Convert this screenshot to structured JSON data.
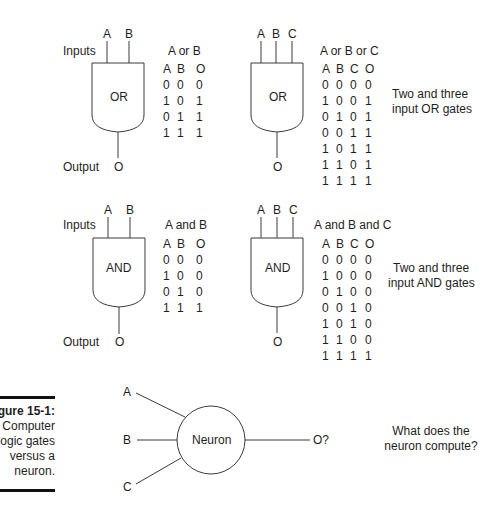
{
  "or_section": {
    "inputs_label": "Inputs",
    "output_label": "Output",
    "two_input": {
      "gate_label": "OR",
      "input_labels": [
        "A",
        "B"
      ],
      "output_label": "O",
      "table_title": "A or B",
      "headers": [
        "A",
        "B",
        "O"
      ],
      "rows": [
        [
          "0",
          "0",
          "0"
        ],
        [
          "1",
          "0",
          "1"
        ],
        [
          "0",
          "1",
          "1"
        ],
        [
          "1",
          "1",
          "1"
        ]
      ]
    },
    "three_input": {
      "gate_label": "OR",
      "input_labels": [
        "A",
        "B",
        "C"
      ],
      "output_label": "O",
      "table_title": "A or B or C",
      "headers": [
        "A",
        "B",
        "C",
        "O"
      ],
      "rows": [
        [
          "0",
          "0",
          "0",
          "0"
        ],
        [
          "1",
          "0",
          "0",
          "1"
        ],
        [
          "0",
          "1",
          "0",
          "1"
        ],
        [
          "0",
          "0",
          "1",
          "1"
        ],
        [
          "1",
          "0",
          "1",
          "1"
        ],
        [
          "1",
          "1",
          "0",
          "1"
        ],
        [
          "1",
          "1",
          "1",
          "1"
        ]
      ]
    },
    "description_line1": "Two and three",
    "description_line2": "input OR gates"
  },
  "and_section": {
    "inputs_label": "Inputs",
    "output_label": "Output",
    "two_input": {
      "gate_label": "AND",
      "input_labels": [
        "A",
        "B"
      ],
      "output_label": "O",
      "table_title": "A and B",
      "headers": [
        "A",
        "B",
        "O"
      ],
      "rows": [
        [
          "0",
          "0",
          "0"
        ],
        [
          "1",
          "0",
          "0"
        ],
        [
          "0",
          "1",
          "0"
        ],
        [
          "1",
          "1",
          "1"
        ]
      ]
    },
    "three_input": {
      "gate_label": "AND",
      "input_labels": [
        "A",
        "B",
        "C"
      ],
      "output_label": "O",
      "table_title": "A and B and C",
      "headers": [
        "A",
        "B",
        "C",
        "O"
      ],
      "rows": [
        [
          "0",
          "0",
          "0",
          "0"
        ],
        [
          "1",
          "0",
          "0",
          "0"
        ],
        [
          "0",
          "1",
          "0",
          "0"
        ],
        [
          "0",
          "0",
          "1",
          "0"
        ],
        [
          "1",
          "0",
          "1",
          "0"
        ],
        [
          "1",
          "1",
          "0",
          "0"
        ],
        [
          "1",
          "1",
          "1",
          "1"
        ]
      ]
    },
    "description_line1": "Two and three",
    "description_line2": "input AND gates"
  },
  "neuron_section": {
    "input_labels": [
      "A",
      "B",
      "C"
    ],
    "neuron_label": "Neuron",
    "output_label": "O?",
    "question_line1": "What does the",
    "question_line2": "neuron compute?"
  },
  "caption": {
    "figure_number": "Figure 15-1:",
    "line1": "Computer",
    "line2": "logic gates",
    "line3": "versus a",
    "line4": "neuron."
  }
}
